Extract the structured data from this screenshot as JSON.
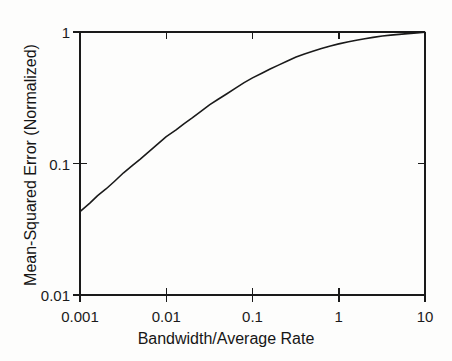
{
  "chart_data": {
    "type": "line",
    "title": "",
    "xlabel": "Bandwidth/Average Rate",
    "ylabel": "Mean-Squared Error (Normalized)",
    "xscale": "log",
    "yscale": "log",
    "xlim": [
      0.001,
      10
    ],
    "ylim": [
      0.01,
      1
    ],
    "grid": false,
    "legend": null,
    "xticks": [
      {
        "value": 0.001,
        "label": "0.001"
      },
      {
        "value": 0.01,
        "label": "0.01"
      },
      {
        "value": 0.1,
        "label": "0.1"
      },
      {
        "value": 1,
        "label": "1"
      },
      {
        "value": 10,
        "label": "10"
      }
    ],
    "yticks": [
      {
        "value": 1,
        "label": "1"
      },
      {
        "value": 0.1,
        "label": "0.1"
      },
      {
        "value": 0.01,
        "label": "0.01"
      }
    ],
    "series": [
      {
        "name": "mean-squared-error",
        "color": "#1a1a1a",
        "line_width": 1.6,
        "x": [
          0.001,
          0.0013,
          0.0016,
          0.002,
          0.0025,
          0.0032,
          0.004,
          0.005,
          0.0063,
          0.008,
          0.01,
          0.013,
          0.016,
          0.02,
          0.025,
          0.032,
          0.04,
          0.05,
          0.063,
          0.08,
          0.1,
          0.13,
          0.16,
          0.2,
          0.25,
          0.32,
          0.4,
          0.5,
          0.63,
          0.8,
          1.0,
          1.3,
          1.6,
          2.0,
          2.5,
          3.2,
          4.0,
          5.0,
          6.3,
          8.0,
          10.0
        ],
        "y": [
          0.043,
          0.05,
          0.057,
          0.064,
          0.073,
          0.085,
          0.096,
          0.108,
          0.123,
          0.141,
          0.16,
          0.18,
          0.2,
          0.222,
          0.248,
          0.28,
          0.308,
          0.338,
          0.373,
          0.412,
          0.448,
          0.488,
          0.523,
          0.56,
          0.6,
          0.645,
          0.681,
          0.713,
          0.748,
          0.783,
          0.812,
          0.842,
          0.866,
          0.888,
          0.91,
          0.932,
          0.947,
          0.96,
          0.972,
          0.984,
          0.996
        ]
      }
    ],
    "axis_style": {
      "frame": "box",
      "ticks_inward": false,
      "tick_length": 7,
      "color": "#1a1a1a"
    }
  }
}
